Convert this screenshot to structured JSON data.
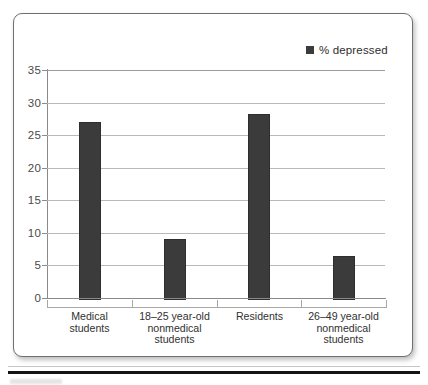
{
  "figure": {
    "frame_border_color": "#6f6f6f",
    "background_color": "#ffffff",
    "bottom_rule_color": "#141414"
  },
  "legend": {
    "swatch_icon": "filled-square-icon",
    "swatch_color": "#3b3b3b",
    "label": "% depressed",
    "position": "top-right"
  },
  "chart_data": {
    "type": "bar",
    "title": "",
    "subtitle": "",
    "xlabel": "",
    "ylabel": "",
    "categories": [
      "Medical\nstudents",
      "18–25 year-old\nnonmedical\nstudents",
      "Residents",
      "26–49 year-old\nnonmedical\nstudents"
    ],
    "category_lines": [
      [
        "Medical",
        "students"
      ],
      [
        "18–25 year-old",
        "nonmedical",
        "students"
      ],
      [
        "Residents"
      ],
      [
        "26–49 year-old",
        "nonmedical",
        "students"
      ]
    ],
    "series": [
      {
        "name": "% depressed",
        "color": "#3b3b3b",
        "values": [
          27,
          9,
          28.2,
          6.5
        ]
      }
    ],
    "values": [
      27,
      9,
      28.2,
      6.5
    ],
    "ylim": [
      0,
      35
    ],
    "ytick_labels": [
      "0",
      "5",
      "10",
      "15",
      "20",
      "25",
      "30",
      "35"
    ],
    "ytick_values": [
      0,
      5,
      10,
      15,
      20,
      25,
      30,
      35
    ],
    "ytick_step": 5,
    "grid": "horizontal-only",
    "grid_color": "#b9b9b9",
    "axis_color": "#8a8a8a",
    "legend_position": "top-right",
    "legend_entries": [
      "% depressed"
    ]
  }
}
